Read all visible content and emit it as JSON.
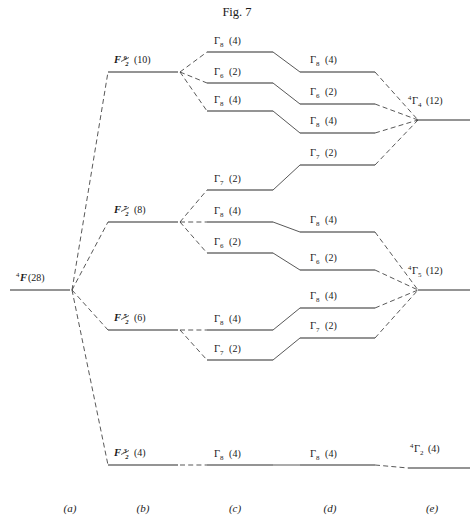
{
  "figure": {
    "title": "Fig. 7",
    "width": 474,
    "height": 529
  },
  "captions": [
    {
      "label": "(a)",
      "x": 70
    },
    {
      "label": "(b)",
      "x": 143
    },
    {
      "label": "(c)",
      "x": 235
    },
    {
      "label": "(d)",
      "x": 330
    },
    {
      "label": "(e)",
      "x": 432
    },
    {
      "y": 512
    }
  ],
  "columns": {
    "a": {
      "caption": "(a)",
      "x1": 10,
      "x2": 70
    },
    "b": {
      "caption": "(b)",
      "x1": 108,
      "x2": 178
    },
    "c": {
      "caption": "(c)",
      "x1": 207,
      "x2": 273
    },
    "d": {
      "caption": "(d)",
      "x1": 300,
      "x2": 375
    },
    "e": {
      "caption": "(e)",
      "x1": 418,
      "x2": 470
    }
  },
  "free_ion": {
    "symbol": "F",
    "superscript": "4",
    "degeneracy": "(28)",
    "label_full": "4F(28)",
    "y": 290,
    "x1": 10,
    "x2": 70,
    "label_x": 16,
    "label_y": 281
  },
  "spin_orbit_levels": [
    {
      "id": "F92",
      "symbol": "F",
      "j_num": "9",
      "j_den": "2",
      "degeneracy": "(10)",
      "y": 72,
      "x1": 108,
      "x2": 178,
      "label_x": 114,
      "label_y": 63
    },
    {
      "id": "F72",
      "symbol": "F",
      "j_num": "7",
      "j_den": "2",
      "degeneracy": "(8)",
      "y": 222,
      "x1": 108,
      "x2": 178,
      "label_x": 114,
      "label_y": 213
    },
    {
      "id": "F52",
      "symbol": "F",
      "j_num": "5",
      "j_den": "2",
      "degeneracy": "(6)",
      "y": 330,
      "x1": 108,
      "x2": 178,
      "label_x": 114,
      "label_y": 321
    },
    {
      "id": "F32",
      "symbol": "F",
      "j_num": "3",
      "j_den": "2",
      "degeneracy": "(4)",
      "y": 465,
      "x1": 108,
      "x2": 178,
      "label_x": 114,
      "label_y": 456
    }
  ],
  "crystal_field_c": [
    {
      "id": "c1",
      "gamma": "8",
      "degeneracy": "(4)",
      "y": 52,
      "x1": 207,
      "x2": 273,
      "label_x": 214,
      "label_y": 44,
      "parent": "F92"
    },
    {
      "id": "c2",
      "gamma": "6",
      "degeneracy": "(2)",
      "y": 83,
      "x1": 207,
      "x2": 273,
      "label_x": 214,
      "label_y": 75,
      "parent": "F92"
    },
    {
      "id": "c3",
      "gamma": "8",
      "degeneracy": "(4)",
      "y": 111,
      "x1": 207,
      "x2": 273,
      "label_x": 214,
      "label_y": 103,
      "parent": "F92"
    },
    {
      "id": "c4",
      "gamma": "7",
      "degeneracy": "(2)",
      "y": 190,
      "x1": 207,
      "x2": 273,
      "label_x": 214,
      "label_y": 182,
      "parent": "F72"
    },
    {
      "id": "c5",
      "gamma": "8",
      "degeneracy": "(4)",
      "y": 222,
      "x1": 207,
      "x2": 273,
      "label_x": 214,
      "label_y": 214,
      "parent": "F72"
    },
    {
      "id": "c6",
      "gamma": "6",
      "degeneracy": "(2)",
      "y": 253,
      "x1": 207,
      "x2": 273,
      "label_x": 214,
      "label_y": 245,
      "parent": "F72"
    },
    {
      "id": "c7",
      "gamma": "8",
      "degeneracy": "(4)",
      "y": 330,
      "x1": 207,
      "x2": 273,
      "label_x": 214,
      "label_y": 322,
      "parent": "F52"
    },
    {
      "id": "c8",
      "gamma": "7",
      "degeneracy": "(2)",
      "y": 360,
      "x1": 207,
      "x2": 273,
      "label_x": 214,
      "label_y": 352,
      "parent": "F52"
    },
    {
      "id": "c9",
      "gamma": "8",
      "degeneracy": "(4)",
      "y": 465,
      "x1": 207,
      "x2": 273,
      "label_x": 214,
      "label_y": 457,
      "parent": "F32"
    }
  ],
  "crystal_field_d": [
    {
      "id": "d1",
      "gamma": "8",
      "degeneracy": "(4)",
      "y": 72,
      "x1": 300,
      "x2": 375,
      "label_x": 310,
      "label_y": 63,
      "from": "c1",
      "to": "G4"
    },
    {
      "id": "d2",
      "gamma": "6",
      "degeneracy": "(2)",
      "y": 104,
      "x1": 300,
      "x2": 375,
      "label_x": 310,
      "label_y": 95,
      "from": "c2",
      "to": "G4"
    },
    {
      "id": "d3",
      "gamma": "8",
      "degeneracy": "(4)",
      "y": 133,
      "x1": 300,
      "x2": 375,
      "label_x": 310,
      "label_y": 124,
      "from": "c3",
      "to": "G4"
    },
    {
      "id": "d4",
      "gamma": "7",
      "degeneracy": "(2)",
      "y": 165,
      "x1": 300,
      "x2": 375,
      "label_x": 310,
      "label_y": 156,
      "from": "c4",
      "to": "G4"
    },
    {
      "id": "d5",
      "gamma": "8",
      "degeneracy": "(4)",
      "y": 232,
      "x1": 300,
      "x2": 375,
      "label_x": 310,
      "label_y": 223,
      "from": "c5",
      "to": "G5"
    },
    {
      "id": "d6",
      "gamma": "6",
      "degeneracy": "(2)",
      "y": 270,
      "x1": 300,
      "x2": 375,
      "label_x": 310,
      "label_y": 261,
      "from": "c6",
      "to": "G5"
    },
    {
      "id": "d7",
      "gamma": "8",
      "degeneracy": "(4)",
      "y": 308,
      "x1": 300,
      "x2": 375,
      "label_x": 310,
      "label_y": 299,
      "from": "c7",
      "to": "G5"
    },
    {
      "id": "d8",
      "gamma": "7",
      "degeneracy": "(2)",
      "y": 338,
      "x1": 300,
      "x2": 375,
      "label_x": 310,
      "label_y": 329,
      "from": "c8",
      "to": "G5"
    },
    {
      "id": "d9",
      "gamma": "8",
      "degeneracy": "(4)",
      "y": 465,
      "x1": 300,
      "x2": 375,
      "label_x": 310,
      "label_y": 457,
      "from": "c9",
      "to": "G2"
    }
  ],
  "final_levels": [
    {
      "id": "G4",
      "superscript": "4",
      "gamma": "4",
      "degeneracy": "(12)",
      "y": 120,
      "x1": 418,
      "x2": 470,
      "label_x": 408,
      "label_y": 104,
      "apex_x": 418
    },
    {
      "id": "G5",
      "superscript": "4",
      "gamma": "5",
      "degeneracy": "(12)",
      "y": 290,
      "x1": 418,
      "x2": 470,
      "label_x": 408,
      "label_y": 274,
      "apex_x": 418
    },
    {
      "id": "G2",
      "superscript": "4",
      "gamma": "2",
      "degeneracy": "(4)",
      "y": 468,
      "x1": 408,
      "x2": 470,
      "label_x": 410,
      "label_y": 452,
      "apex_x": 408
    }
  ],
  "symbols": {
    "gamma": "Γ",
    "free_ion_letter": "F"
  }
}
